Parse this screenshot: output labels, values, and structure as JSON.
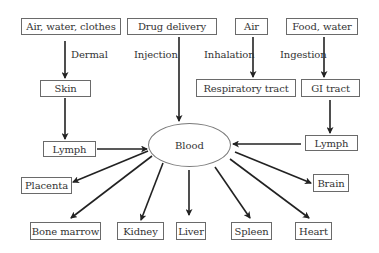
{
  "diagram": {
    "sources": {
      "air_water_clothes": "Air, water, clothes",
      "drug_delivery": "Drug delivery",
      "air": "Air",
      "food_water": "Food, water"
    },
    "routes": {
      "dermal": "Dermal",
      "injection": "Injection",
      "inhalation": "Inhalation",
      "ingestion": "Ingestion"
    },
    "entry_points": {
      "skin": "Skin",
      "respiratory_tract": "Respiratory tract",
      "gi_tract": "GI tract"
    },
    "lymph_left": "Lymph",
    "lymph_right": "Lymph",
    "central": "Blood",
    "targets": {
      "placenta": "Placenta",
      "bone_marrow": "Bone marrow",
      "kidney": "Kidney",
      "liver": "Liver",
      "spleen": "Spleen",
      "heart": "Heart",
      "brain": "Brain"
    },
    "colors": {
      "arrow": "#222222",
      "box_border": "#6a6a6a",
      "text": "#333333"
    }
  }
}
